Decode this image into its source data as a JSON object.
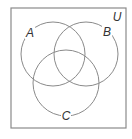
{
  "diagram": {
    "type": "venn",
    "universe": {
      "label": "U",
      "x": 11,
      "y": 8,
      "width": 115,
      "height": 120,
      "label_x": 117,
      "label_y": 21
    },
    "sets": [
      {
        "label": "A",
        "cx": 53,
        "cy": 54,
        "r": 32,
        "label_x": 30,
        "label_y": 37
      },
      {
        "label": "B",
        "cx": 86,
        "cy": 54,
        "r": 32,
        "label_x": 107,
        "label_y": 36
      },
      {
        "label": "C",
        "cx": 66,
        "cy": 83,
        "r": 33,
        "label_x": 66,
        "label_y": 120
      }
    ],
    "colors": {
      "stroke": "#8a8a8a",
      "box_stroke": "#8a8a8a",
      "label": "#333333",
      "background": "#ffffff"
    }
  }
}
